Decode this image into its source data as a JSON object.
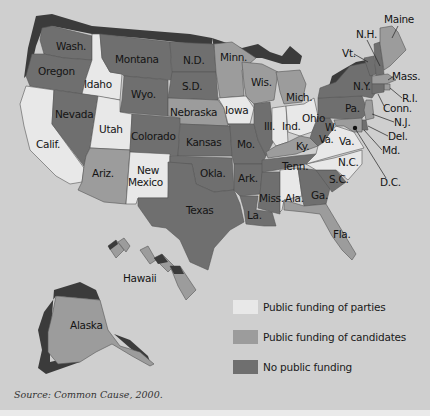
{
  "colors": {
    "background": "#cfcfcf",
    "parties": "#e8e8e8",
    "candidates": "#9c9c9c",
    "none": "#6f6f6f",
    "relief": "#3b3b3b"
  },
  "legend": {
    "items": [
      {
        "key": "parties",
        "label": "Public funding of parties",
        "color": "#e8e8e8"
      },
      {
        "key": "candidates",
        "label": "Public funding of candidates",
        "color": "#9c9c9c"
      },
      {
        "key": "none",
        "label": "No public funding",
        "color": "#6f6f6f"
      }
    ]
  },
  "source": "Source: Common Cause, 2000.",
  "states": {
    "wa": {
      "label": "Wash.",
      "category": "none"
    },
    "or": {
      "label": "Oregon",
      "category": "none"
    },
    "ca": {
      "label": "Calif.",
      "category": "parties"
    },
    "id": {
      "label": "Idaho",
      "category": "parties"
    },
    "nv": {
      "label": "Nevada",
      "category": "none"
    },
    "mt": {
      "label": "Montana",
      "category": "none"
    },
    "wy": {
      "label": "Wyo.",
      "category": "none"
    },
    "ut": {
      "label": "Utah",
      "category": "parties"
    },
    "az": {
      "label": "Ariz.",
      "category": "candidates"
    },
    "co": {
      "label": "Colorado",
      "category": "none"
    },
    "nm": {
      "label": "New Mexico",
      "label_line1": "New",
      "label_line2": "Mexico",
      "category": "parties"
    },
    "nd": {
      "label": "N.D.",
      "category": "none"
    },
    "sd": {
      "label": "S.D.",
      "category": "none"
    },
    "ne": {
      "label": "Nebraska",
      "category": "candidates"
    },
    "ks": {
      "label": "Kansas",
      "category": "none"
    },
    "ok": {
      "label": "Okla.",
      "category": "none"
    },
    "tx": {
      "label": "Texas",
      "category": "none"
    },
    "mn": {
      "label": "Minn.",
      "category": "candidates"
    },
    "ia": {
      "label": "Iowa",
      "category": "parties"
    },
    "mo": {
      "label": "Mo.",
      "category": "none"
    },
    "ar": {
      "label": "Ark.",
      "category": "none"
    },
    "la": {
      "label": "La.",
      "category": "none"
    },
    "wi": {
      "label": "Wis.",
      "category": "candidates"
    },
    "il": {
      "label": "Ill.",
      "category": "none"
    },
    "ms": {
      "label": "Miss.",
      "category": "none"
    },
    "mi": {
      "label": "Mich.",
      "category": "candidates"
    },
    "in": {
      "label": "Ind.",
      "category": "parties"
    },
    "oh": {
      "label": "Ohio",
      "category": "parties"
    },
    "ky": {
      "label": "Ky.",
      "category": "candidates"
    },
    "tn": {
      "label": "Tenn.",
      "category": "none"
    },
    "al": {
      "label": "Ala.",
      "category": "parties"
    },
    "ga": {
      "label": "Ga.",
      "category": "none"
    },
    "fl": {
      "label": "Fla.",
      "category": "candidates"
    },
    "sc": {
      "label": "S.C.",
      "category": "none"
    },
    "nc": {
      "label": "N.C.",
      "category": "parties"
    },
    "va": {
      "label": "Va.",
      "category": "parties"
    },
    "wv": {
      "label": "W. Va.",
      "label_line1": "W.",
      "label_line2": "Va.",
      "category": "none"
    },
    "pa": {
      "label": "Pa.",
      "category": "none"
    },
    "ny": {
      "label": "N.Y.",
      "category": "none"
    },
    "vt": {
      "label": "Vt.",
      "category": "none"
    },
    "nh": {
      "label": "N.H.",
      "category": "none"
    },
    "me": {
      "label": "Maine",
      "category": "candidates"
    },
    "ma": {
      "label": "Mass.",
      "category": "candidates"
    },
    "ri": {
      "label": "R.I.",
      "category": "candidates"
    },
    "ct": {
      "label": "Conn.",
      "category": "none"
    },
    "nj": {
      "label": "N.J.",
      "category": "candidates"
    },
    "de": {
      "label": "Del.",
      "category": "none"
    },
    "md": {
      "label": "Md.",
      "category": "candidates"
    },
    "dc": {
      "label": "D.C.",
      "category": "none"
    },
    "ak": {
      "label": "Alaska",
      "category": "candidates"
    },
    "hi": {
      "label": "Hawaii",
      "category": "candidates"
    }
  }
}
